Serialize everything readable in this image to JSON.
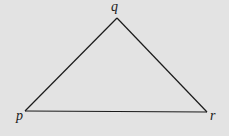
{
  "diagram": {
    "type": "triangle",
    "background": "#e3e3e3",
    "stroke": "#1a1a1a",
    "vertices": [
      {
        "name": "p",
        "label": "p",
        "x": 25,
        "y": 111
      },
      {
        "name": "q",
        "label": "q",
        "x": 117,
        "y": 18
      },
      {
        "name": "r",
        "label": "r",
        "x": 207,
        "y": 112
      }
    ],
    "edges": [
      {
        "from": "p",
        "to": "q"
      },
      {
        "from": "q",
        "to": "r"
      },
      {
        "from": "r",
        "to": "p"
      }
    ]
  }
}
